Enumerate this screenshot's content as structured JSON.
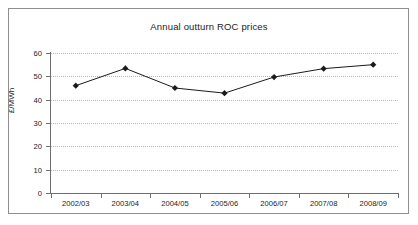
{
  "chart_data": {
    "type": "line",
    "title": "Annual outturn ROC prices",
    "xlabel": "",
    "ylabel": "£/MWh",
    "categories": [
      "2002/03",
      "2003/04",
      "2004/05",
      "2005/06",
      "2006/07",
      "2007/08",
      "2008/09"
    ],
    "values": [
      46.0,
      53.4,
      45.0,
      42.8,
      49.7,
      53.3,
      55.0
    ],
    "series": [
      {
        "name": "Annual outturn ROC price",
        "values": [
          46.0,
          53.4,
          45.0,
          42.8,
          49.7,
          53.3,
          55.0
        ]
      }
    ],
    "ylim": [
      0,
      60
    ],
    "yticks": [
      0,
      10,
      20,
      30,
      40,
      50,
      60
    ],
    "ytick_labels": [
      "0",
      "10",
      "20",
      "30",
      "40",
      "50",
      "60"
    ],
    "grid": true,
    "grid_axis": "y",
    "grid_style": "dotted",
    "legend": false,
    "legend_position": "none",
    "marker": "diamond",
    "line_color": "#1b1b1b",
    "marker_color": "#1b1b1b",
    "grid_color": "#b9b9b9",
    "axis_color": "#6e6e6e",
    "background_color": "#ffffff",
    "frame_color": "#8e8e8e"
  },
  "colors": {
    "accent": "#1b1b1b",
    "grid": "#b9b9b9",
    "axis": "#6e6e6e",
    "frame": "#8e8e8e",
    "background": "#ffffff"
  }
}
